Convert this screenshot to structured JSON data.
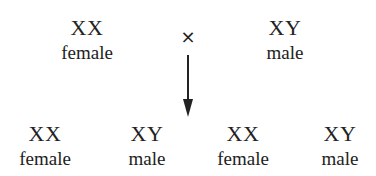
{
  "parents": [
    {
      "genotype": "XX",
      "sex": "female"
    },
    {
      "genotype": "XY",
      "sex": "male"
    }
  ],
  "cross_symbol": "×",
  "offspring": [
    {
      "genotype": "XX",
      "sex": "female"
    },
    {
      "genotype": "XY",
      "sex": "male"
    },
    {
      "genotype": "XX",
      "sex": "female"
    },
    {
      "genotype": "XY",
      "sex": "male"
    }
  ]
}
